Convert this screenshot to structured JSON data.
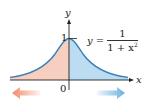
{
  "figure": {
    "axis_labels": {
      "x": "x",
      "y": "y"
    },
    "ticks": {
      "origin": "0",
      "y_one": "1"
    },
    "equation": {
      "lhs": "y =",
      "numerator": "1",
      "denominator_base": "1 + x",
      "denominator_exponent": "2"
    },
    "colors": {
      "curve": "#3a7fb5",
      "left_fill": "#f6cfc0",
      "right_fill": "#bcdcf2",
      "left_arrow": "#f08a6a",
      "right_arrow": "#6ab0e0",
      "axis": "#222222"
    }
  }
}
